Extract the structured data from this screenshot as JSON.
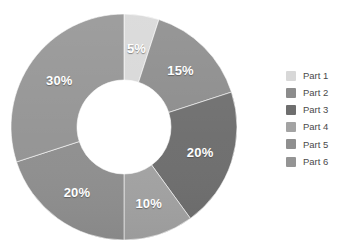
{
  "chart_data": {
    "type": "pie",
    "variant": "donut",
    "title": "",
    "subtitle": "",
    "xlabel": "",
    "ylabel": "",
    "grid": false,
    "legend_position": "right",
    "start_angle_deg": 0,
    "direction": "clockwise",
    "categories": [
      "Part 1",
      "Part 2",
      "Part 3",
      "Part 4",
      "Part 5",
      "Part 6"
    ],
    "values": [
      5,
      15,
      20,
      10,
      20,
      30
    ],
    "data_labels": [
      "5%",
      "15%",
      "20%",
      "10%",
      "20%",
      "30%"
    ],
    "colors": [
      "#d8d8d8",
      "#8c8c8c",
      "#6e6e6e",
      "#a3a3a3",
      "#8f8f8f",
      "#949494"
    ],
    "slices": [
      {
        "label": "Part 1",
        "value": 5,
        "data_label": "5%",
        "color": "#d8d8d8"
      },
      {
        "label": "Part 2",
        "value": 15,
        "data_label": "15%",
        "color": "#8c8c8c"
      },
      {
        "label": "Part 3",
        "value": 20,
        "data_label": "20%",
        "color": "#6e6e6e"
      },
      {
        "label": "Part 4",
        "value": 10,
        "data_label": "10%",
        "color": "#a3a3a3"
      },
      {
        "label": "Part 5",
        "value": 20,
        "data_label": "20%",
        "color": "#8f8f8f"
      },
      {
        "label": "Part 6",
        "value": 30,
        "data_label": "30%",
        "color": "#949494"
      }
    ]
  },
  "legend": {
    "items": [
      {
        "label": "Part 1",
        "color": "#d8d8d8"
      },
      {
        "label": "Part 2",
        "color": "#8c8c8c"
      },
      {
        "label": "Part 3",
        "color": "#6e6e6e"
      },
      {
        "label": "Part 4",
        "color": "#a3a3a3"
      },
      {
        "label": "Part 5",
        "color": "#8f8f8f"
      },
      {
        "label": "Part 6",
        "color": "#949494"
      }
    ]
  },
  "geometry": {
    "cx": 124,
    "cy": 127,
    "outer_r": 113,
    "inner_r": 47,
    "label_r": 80
  },
  "canvas": {
    "background": "#ffffff",
    "label_color": "#ffffff"
  }
}
